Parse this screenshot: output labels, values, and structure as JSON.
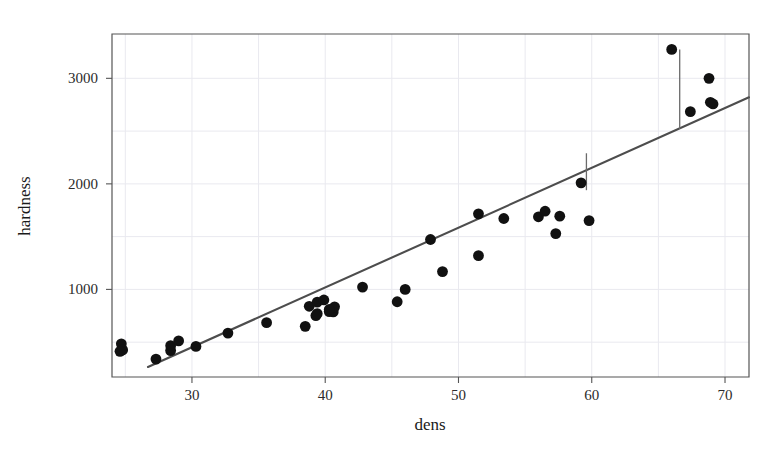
{
  "figure": {
    "background_color": "#ffffff",
    "point_color": "#111111",
    "line_color": "#4d4d4d",
    "grid_color": "#e9e9ef",
    "frame_color": "#555555"
  },
  "chart_data": {
    "type": "scatter",
    "title": "",
    "xlabel": "dens",
    "ylabel": "hardness",
    "xlim": [
      24.0,
      71.8
    ],
    "ylim": [
      170,
      3420
    ],
    "xticks": [
      30,
      40,
      50,
      60,
      70
    ],
    "xtick_labels": [
      "30",
      "40",
      "50",
      "60",
      "70"
    ],
    "yticks": [
      1000,
      2000,
      3000
    ],
    "ytick_labels": [
      "1000",
      "2000",
      "3000"
    ],
    "minor_xticks": [
      25,
      35,
      45,
      55,
      65
    ],
    "minor_yticks": [
      500,
      1500,
      2500
    ],
    "grid": true,
    "legend": null,
    "series": [
      {
        "name": "observations",
        "marker": "circle",
        "color": "#111111",
        "points": [
          [
            24.7,
            484
          ],
          [
            24.8,
            427
          ],
          [
            24.6,
            413
          ],
          [
            27.3,
            340
          ],
          [
            28.4,
            420
          ],
          [
            28.4,
            467
          ],
          [
            29.0,
            512
          ],
          [
            30.3,
            460
          ],
          [
            32.7,
            586
          ],
          [
            35.6,
            685
          ],
          [
            38.5,
            650
          ],
          [
            38.8,
            840
          ],
          [
            39.3,
            752
          ],
          [
            39.4,
            880
          ],
          [
            39.9,
            900
          ],
          [
            40.3,
            790
          ],
          [
            40.6,
            787
          ],
          [
            40.7,
            835
          ],
          [
            40.3,
            810
          ],
          [
            39.4,
            770
          ],
          [
            42.8,
            1022
          ],
          [
            45.4,
            883
          ],
          [
            46.0,
            1000
          ],
          [
            47.9,
            1473
          ],
          [
            48.8,
            1169
          ],
          [
            51.5,
            1716
          ],
          [
            51.5,
            1320
          ],
          [
            53.4,
            1672
          ],
          [
            56.0,
            1688
          ],
          [
            56.5,
            1741
          ],
          [
            57.3,
            1529
          ],
          [
            57.6,
            1694
          ],
          [
            59.2,
            2010
          ],
          [
            59.8,
            1652
          ],
          [
            66.0,
            3274
          ],
          [
            67.4,
            2684
          ],
          [
            68.8,
            3000
          ],
          [
            69.1,
            2757
          ],
          [
            68.9,
            2773
          ]
        ]
      }
    ],
    "fit_line": {
      "name": "least-squares fit",
      "type": "linear",
      "color": "#4d4d4d",
      "x_start": 26.7,
      "y_start": 265,
      "x_end": 71.8,
      "y_end": 2820
    },
    "residual_segments": [
      {
        "x": 59.6,
        "y_point": 1940,
        "y_fit": 2290
      },
      {
        "x": 66.6,
        "y_point": 3274,
        "y_fit": 2520
      }
    ],
    "annotations": []
  },
  "axes": {
    "x_axis_label": "dens",
    "y_axis_label": "hardness"
  }
}
